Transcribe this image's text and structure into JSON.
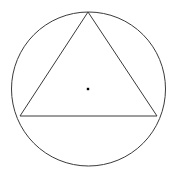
{
  "figure": {
    "canvas": {
      "width": 175,
      "height": 174,
      "background_color": "#ffffff"
    },
    "circle": {
      "name": "circumscribed-circle",
      "center_x": 88.5,
      "center_y": 89,
      "radius": 77,
      "stroke_color": "#3a3a3a",
      "stroke_width": 1,
      "fill": "none"
    },
    "triangle": {
      "name": "inscribed-triangle",
      "vertices": [
        {
          "label": "apex",
          "x": 88,
          "y": 12
        },
        {
          "label": "bottom-right",
          "x": 157,
          "y": 116
        },
        {
          "label": "bottom-left",
          "x": 20,
          "y": 116
        }
      ],
      "points_attr": "88,12 157,116 20,116",
      "stroke_color": "#3a3a3a",
      "stroke_width": 1,
      "fill": "none"
    },
    "center_marker": {
      "name": "circle-center-dot",
      "x": 88,
      "y": 89,
      "size": 2.4,
      "color": "#000000",
      "shape": "square"
    }
  }
}
